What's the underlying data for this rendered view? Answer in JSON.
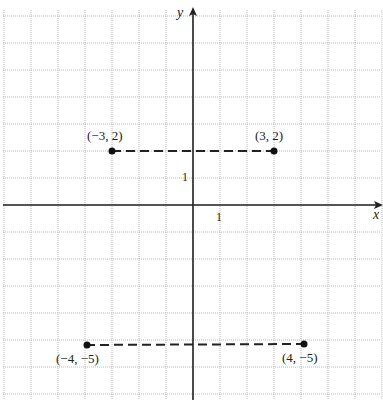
{
  "chart_data": {
    "type": "scatter",
    "title": "",
    "xlabel": "x",
    "ylabel": "y",
    "xlim": [
      -7,
      7
    ],
    "ylim": [
      -7,
      7
    ],
    "grid": true,
    "tick_labels": {
      "x": "1",
      "y": "1"
    },
    "points": [
      {
        "x": -3,
        "y": 2,
        "label": "(−3, 2)"
      },
      {
        "x": 3,
        "y": 2,
        "label": "(3, 2)"
      },
      {
        "x": -4,
        "y": -5,
        "label": "(−4, −5)"
      },
      {
        "x": 4,
        "y": -5,
        "label": "(4, −5)"
      }
    ],
    "segments": [
      {
        "from": [
          -3,
          2
        ],
        "to": [
          3,
          2
        ],
        "style": "dashed"
      },
      {
        "from": [
          -4,
          -5
        ],
        "to": [
          4,
          -5
        ],
        "style": "dashed"
      }
    ]
  },
  "labels": {
    "p1": "(−3, 2)",
    "p2": "(3, 2)",
    "p3": "(−4, −5)",
    "p4": "(4, −5)",
    "x_axis": "x",
    "y_axis": "y",
    "x_tick": "1",
    "y_tick": "1"
  }
}
